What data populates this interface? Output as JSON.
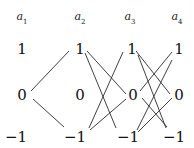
{
  "columns": [
    {
      "label": "a",
      "sub": "1",
      "x": 22
    },
    {
      "label": "a",
      "sub": "2",
      "x": 80
    },
    {
      "label": "a",
      "sub": "3",
      "x": 130
    },
    {
      "label": "a",
      "sub": "4",
      "x": 177
    }
  ],
  "rows": [
    {
      "label": "1",
      "y": 49
    },
    {
      "label": "0",
      "y": 95
    },
    {
      "label": "−1",
      "y": 137
    }
  ],
  "header_y": 18,
  "edges": [
    {
      "from": [
        0,
        "0"
      ],
      "to": [
        1,
        "1"
      ]
    },
    {
      "from": [
        0,
        "0"
      ],
      "to": [
        1,
        "-1"
      ]
    },
    {
      "from": [
        1,
        "1"
      ],
      "to": [
        2,
        "0"
      ]
    },
    {
      "from": [
        1,
        "1"
      ],
      "to": [
        2,
        "-1"
      ]
    },
    {
      "from": [
        1,
        "-1"
      ],
      "to": [
        2,
        "1"
      ]
    },
    {
      "from": [
        1,
        "-1"
      ],
      "to": [
        2,
        "0"
      ]
    },
    {
      "from": [
        2,
        "1"
      ],
      "to": [
        3,
        "0"
      ]
    },
    {
      "from": [
        2,
        "1"
      ],
      "to": [
        3,
        "-1"
      ]
    },
    {
      "from": [
        2,
        "0"
      ],
      "to": [
        3,
        "1"
      ]
    },
    {
      "from": [
        2,
        "0"
      ],
      "to": [
        3,
        "-1"
      ]
    },
    {
      "from": [
        2,
        "-1"
      ],
      "to": [
        3,
        "1"
      ]
    },
    {
      "from": [
        2,
        "-1"
      ],
      "to": [
        3,
        "0"
      ]
    }
  ],
  "labels": {
    "a1": "a",
    "a1_sub": "1",
    "a2": "a",
    "a2_sub": "2",
    "a3": "a",
    "a3_sub": "3",
    "a4": "a",
    "a4_sub": "4",
    "one": "1",
    "zero": "0",
    "minus_one": "−1"
  }
}
